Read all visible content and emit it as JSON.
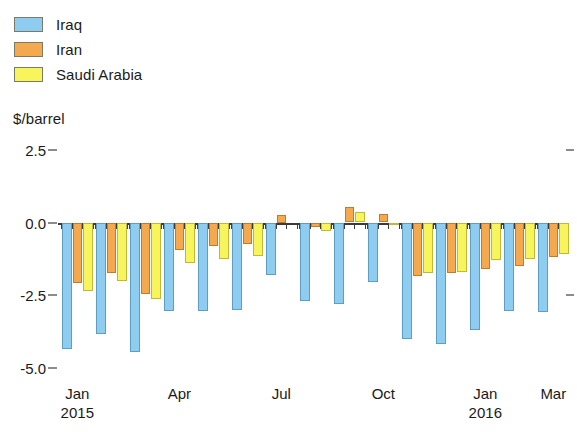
{
  "legend": {
    "position": "top-left",
    "items": [
      {
        "label": "Iraq",
        "color": "#8ecdf0",
        "icon": "legend-swatch"
      },
      {
        "label": "Iran",
        "color": "#f5a94e",
        "icon": "legend-swatch"
      },
      {
        "label": "Saudi Arabia",
        "color": "#f7f45c",
        "icon": "legend-swatch"
      }
    ]
  },
  "axis": {
    "y_title": "$/barrel",
    "y_ticks": [
      "2.5",
      "0.0",
      "-2.5",
      "-5.0"
    ],
    "x_ticks": [
      {
        "label": "Jan\n2015",
        "group": 0
      },
      {
        "label": "Apr",
        "group": 3
      },
      {
        "label": "Jul",
        "group": 6
      },
      {
        "label": "Oct",
        "group": 9
      },
      {
        "label": "Jan\n2016",
        "group": 12
      },
      {
        "label": "Mar",
        "group": 14
      }
    ]
  },
  "chart_data": {
    "type": "bar",
    "title": "",
    "subtitle": "",
    "xlabel": "",
    "ylabel": "$/barrel",
    "ylim": [
      -5.0,
      2.5
    ],
    "yticks": [
      2.5,
      0.0,
      -2.5,
      -5.0
    ],
    "grid": false,
    "legend_position": "top-left",
    "categories": [
      "Jan 2015",
      "Feb 2015",
      "Mar 2015",
      "Apr 2015",
      "May 2015",
      "Jun 2015",
      "Jul 2015",
      "Aug 2015",
      "Sep 2015",
      "Oct 2015",
      "Nov 2015",
      "Dec 2015",
      "Jan 2016",
      "Feb 2016",
      "Mar 2016"
    ],
    "series": [
      {
        "name": "Iraq",
        "color": "#8ecdf0",
        "values": [
          -4.35,
          -3.85,
          -4.45,
          -3.05,
          -3.05,
          -3.0,
          -1.8,
          -2.7,
          -2.8,
          -2.05,
          -4.0,
          -4.2,
          -3.7,
          -3.05,
          -3.1
        ]
      },
      {
        "name": "Iran",
        "color": "#f5a94e",
        "values": [
          -2.1,
          -1.75,
          -2.45,
          -0.95,
          -0.8,
          -0.75,
          0.25,
          -0.15,
          0.55,
          0.3,
          -1.85,
          -1.75,
          -1.6,
          -1.5,
          -1.2
        ]
      },
      {
        "name": "Saudi Arabia",
        "color": "#f7f45c",
        "values": [
          -2.35,
          -2.0,
          -2.65,
          -1.4,
          -1.25,
          -1.15,
          0.0,
          -0.3,
          0.35,
          -0.05,
          -1.75,
          -1.7,
          -1.3,
          -1.25,
          -1.1
        ]
      }
    ]
  }
}
